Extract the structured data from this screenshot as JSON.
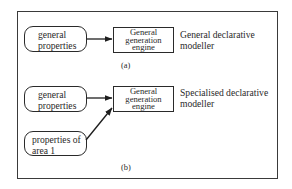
{
  "diagram": {
    "panel_a": {
      "input_box": {
        "line1": "general",
        "line2": "properties"
      },
      "engine_box": {
        "line1": "General",
        "line2": "generation",
        "line3": "engine"
      },
      "description": {
        "line1": "General declarative",
        "line2": "modeller"
      },
      "caption": "(a)"
    },
    "panel_b": {
      "input_box": {
        "line1": "general",
        "line2": "properties"
      },
      "area_box": {
        "line1": "properties of",
        "line2": "area 1"
      },
      "engine_box": {
        "line1": "General",
        "line2": "generation",
        "line3": "engine"
      },
      "description": {
        "line1": "Specialised declarative",
        "line2": "modeller"
      },
      "caption": "(b)"
    },
    "colors": {
      "stroke": "#2a2a2a",
      "background": "#ffffff"
    }
  }
}
